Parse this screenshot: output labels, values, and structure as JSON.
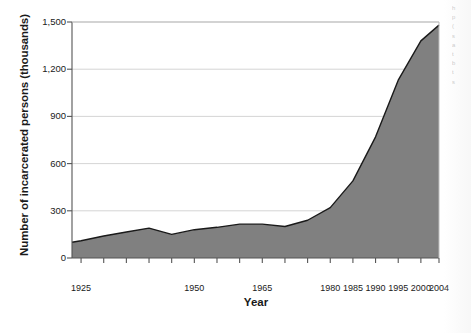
{
  "chart_data": {
    "type": "area",
    "title": "",
    "xlabel": "Year",
    "ylabel": "Number of incarcerated persons (thousands)",
    "xlim": [
      1923,
      2004
    ],
    "ylim": [
      0,
      1500
    ],
    "grid": true,
    "grid_axis": "y",
    "legend": "none",
    "fill_color": "#808080",
    "line_color": "#1a1a1a",
    "x_tick_labels": [
      "1925",
      "1950",
      "1965",
      "1980",
      "1985",
      "1990",
      "1995",
      "2000",
      "2004"
    ],
    "x_tick_label_values": [
      1925,
      1950,
      1965,
      1980,
      1985,
      1990,
      1995,
      2000,
      2004
    ],
    "x_minor_tick_values": [
      1925,
      1930,
      1935,
      1940,
      1945,
      1950,
      1955,
      1960,
      1965,
      1970,
      1975,
      1980,
      1985,
      1990,
      1995,
      2000,
      2004
    ],
    "y_tick_labels": [
      "0",
      "300",
      "600",
      "900",
      "1,200",
      "1,500"
    ],
    "y_tick_values": [
      0,
      300,
      600,
      900,
      1200,
      1500
    ],
    "x": [
      1923,
      1925,
      1930,
      1935,
      1940,
      1945,
      1950,
      1955,
      1960,
      1965,
      1970,
      1975,
      1980,
      1985,
      1990,
      1995,
      2000,
      2004
    ],
    "values": [
      100,
      110,
      140,
      165,
      190,
      150,
      180,
      195,
      215,
      215,
      200,
      240,
      320,
      490,
      770,
      1130,
      1380,
      1480
    ],
    "series": [
      {
        "name": "Number of incarcerated persons (thousands)",
        "values": [
          100,
          110,
          140,
          165,
          190,
          150,
          180,
          195,
          215,
          215,
          200,
          240,
          320,
          490,
          770,
          1130,
          1380,
          1480
        ]
      }
    ]
  },
  "axis": {
    "y_title": "Number of incarcerated persons (thousands)",
    "x_title": "Year"
  },
  "side_column": {
    "lines": [
      "h",
      "p",
      "(",
      "s",
      "a",
      "t",
      "b",
      "t",
      "s"
    ]
  }
}
